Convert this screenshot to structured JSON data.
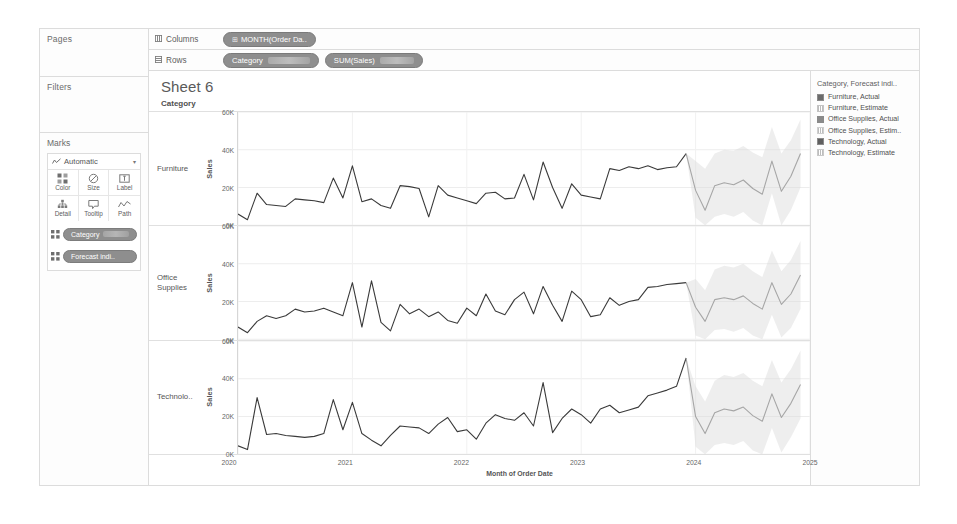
{
  "worksheet": {
    "title": "Sheet 6"
  },
  "shelves": {
    "pages_label": "Pages",
    "filters_label": "Filters",
    "marks_label": "Marks",
    "columns_label": "Columns",
    "rows_label": "Rows",
    "columns_pills": [
      {
        "name": "columns-pill-month-order-date",
        "label": "MONTH(Order Da..",
        "glyph": "⊞"
      }
    ],
    "rows_pills": [
      {
        "name": "rows-pill-category",
        "label": "Category",
        "glyph": ""
      },
      {
        "name": "rows-pill-sum-sales",
        "label": "SUM(Sales)",
        "glyph": ""
      }
    ]
  },
  "marks": {
    "type_label": "Automatic",
    "type_icon": "line-mark-icon",
    "caret": "▾",
    "buttons": [
      {
        "name": "marks-color-button",
        "label": "Color",
        "icon": "color-icon"
      },
      {
        "name": "marks-size-button",
        "label": "Size",
        "icon": "size-icon"
      },
      {
        "name": "marks-label-button",
        "label": "Label",
        "icon": "label-icon"
      },
      {
        "name": "marks-detail-button",
        "label": "Detail",
        "icon": "detail-icon"
      },
      {
        "name": "marks-tooltip-button",
        "label": "Tooltip",
        "icon": "tooltip-icon"
      },
      {
        "name": "marks-path-button",
        "label": "Path",
        "icon": "path-icon"
      }
    ],
    "pills": [
      {
        "name": "marks-pill-category",
        "label": "Category"
      },
      {
        "name": "marks-pill-forecast-indicator",
        "label": "Forecast indi.."
      }
    ]
  },
  "legend": {
    "title": "Category, Forecast indi..",
    "items": [
      {
        "label": "Furniture, Actual",
        "style": "solid",
        "color": "#6b6b6b"
      },
      {
        "label": "Furniture, Estimate",
        "style": "hatch",
        "color": "#c4c4c4"
      },
      {
        "label": "Office Supplies, Actual",
        "style": "solid",
        "color": "#8a8a8a"
      },
      {
        "label": "Office Supplies, Estim..",
        "style": "hatch",
        "color": "#cfcfcf"
      },
      {
        "label": "Technology, Actual",
        "style": "solid",
        "color": "#5f5f5f"
      },
      {
        "label": "Technology, Estimate",
        "style": "hatch",
        "color": "#c9c9c9"
      }
    ]
  },
  "chart_data": {
    "type": "line",
    "title": "Sheet 6",
    "xlabel": "Month of Order Date",
    "ylabel": "Sales",
    "row_header": "Category",
    "grid": true,
    "legend_position": "right",
    "xlim": [
      2020.0,
      2025.0
    ],
    "xticks": [
      "2020",
      "2021",
      "2022",
      "2023",
      "2024",
      "2025"
    ],
    "xtick_values": [
      2020,
      2021,
      2022,
      2023,
      2024,
      2025
    ],
    "ylim": [
      0,
      60000
    ],
    "yticks": [
      "0K",
      "20K",
      "40K",
      "60K"
    ],
    "ytick_values": [
      0,
      20000,
      40000,
      60000
    ],
    "forecast_start": 2023.92,
    "panels": [
      {
        "category": "Furniture",
        "label": "Furniture",
        "actual": {
          "x": [
            2020.0,
            2020.083,
            2020.167,
            2020.25,
            2020.333,
            2020.417,
            2020.5,
            2020.583,
            2020.667,
            2020.75,
            2020.833,
            2020.917,
            2021.0,
            2021.083,
            2021.167,
            2021.25,
            2021.333,
            2021.417,
            2021.5,
            2021.583,
            2021.667,
            2021.75,
            2021.833,
            2021.917,
            2022.0,
            2022.083,
            2022.167,
            2022.25,
            2022.333,
            2022.417,
            2022.5,
            2022.583,
            2022.667,
            2022.75,
            2022.833,
            2022.917,
            2023.0,
            2023.083,
            2023.167,
            2023.25,
            2023.333,
            2023.417,
            2023.5,
            2023.583,
            2023.667,
            2023.75,
            2023.833,
            2023.917
          ],
          "y": [
            6000,
            3000,
            17000,
            11000,
            10500,
            10000,
            14000,
            13500,
            13000,
            12000,
            25000,
            14500,
            31500,
            12500,
            14000,
            10500,
            9000,
            21000,
            20500,
            19500,
            4500,
            21000,
            16000,
            14500,
            13000,
            11500,
            17000,
            17500,
            14000,
            14500,
            27000,
            13500,
            33500,
            20000,
            9000,
            22000,
            16000,
            15000,
            14000,
            30000,
            29000,
            31000,
            30000,
            31500,
            29500,
            30500,
            31000,
            38000
          ]
        },
        "forecast": {
          "x": [
            2023.917,
            2024.0,
            2024.083,
            2024.167,
            2024.25,
            2024.333,
            2024.417,
            2024.5,
            2024.583,
            2024.667,
            2024.75,
            2024.833,
            2024.917
          ],
          "y": [
            38000,
            18500,
            8000,
            21000,
            22500,
            21500,
            24000,
            19500,
            16500,
            34000,
            18000,
            26000,
            38000
          ],
          "ci_upper": [
            38000,
            34000,
            30000,
            38000,
            40000,
            39500,
            42000,
            38500,
            36000,
            52000,
            38000,
            45000,
            56000
          ],
          "ci_lower": [
            38000,
            4000,
            0,
            4500,
            6000,
            4500,
            7000,
            2500,
            0,
            17000,
            0,
            8000,
            20000
          ]
        }
      },
      {
        "category": "Office Supplies",
        "label": "Office Supplies",
        "actual": {
          "x": [
            2020.0,
            2020.083,
            2020.167,
            2020.25,
            2020.333,
            2020.417,
            2020.5,
            2020.583,
            2020.667,
            2020.75,
            2020.833,
            2020.917,
            2021.0,
            2021.083,
            2021.167,
            2021.25,
            2021.333,
            2021.417,
            2021.5,
            2021.583,
            2021.667,
            2021.75,
            2021.833,
            2021.917,
            2022.0,
            2022.083,
            2022.167,
            2022.25,
            2022.333,
            2022.417,
            2022.5,
            2022.583,
            2022.667,
            2022.75,
            2022.833,
            2022.917,
            2023.0,
            2023.083,
            2023.167,
            2023.25,
            2023.333,
            2023.417,
            2023.5,
            2023.583,
            2023.667,
            2023.75,
            2023.833,
            2023.917
          ],
          "y": [
            6500,
            3500,
            9500,
            12500,
            11000,
            12500,
            16000,
            14500,
            15000,
            16500,
            14500,
            12500,
            30000,
            6500,
            31000,
            9000,
            4500,
            18500,
            13500,
            16000,
            12000,
            14500,
            10000,
            8500,
            16500,
            12500,
            24000,
            15000,
            13000,
            21000,
            25000,
            13500,
            28000,
            18000,
            9500,
            25500,
            21000,
            12000,
            13000,
            22000,
            18000,
            20000,
            21000,
            27500,
            28000,
            29000,
            29500,
            30000
          ]
        },
        "forecast": {
          "x": [
            2023.917,
            2024.0,
            2024.083,
            2024.167,
            2024.25,
            2024.333,
            2024.417,
            2024.5,
            2024.583,
            2024.667,
            2024.75,
            2024.833,
            2024.917
          ],
          "y": [
            30000,
            17000,
            9500,
            21000,
            22000,
            21000,
            23000,
            19000,
            16000,
            30000,
            18500,
            24000,
            34000
          ],
          "ci_upper": [
            30000,
            32000,
            26000,
            37000,
            39000,
            38000,
            40000,
            36000,
            33000,
            47000,
            36000,
            42000,
            52000
          ],
          "ci_lower": [
            30000,
            2000,
            0,
            5000,
            5500,
            4000,
            6000,
            2000,
            0,
            13000,
            1000,
            6000,
            16000
          ]
        }
      },
      {
        "category": "Technology",
        "label": "Technolo..",
        "actual": {
          "x": [
            2020.0,
            2020.083,
            2020.167,
            2020.25,
            2020.333,
            2020.417,
            2020.5,
            2020.583,
            2020.667,
            2020.75,
            2020.833,
            2020.917,
            2021.0,
            2021.083,
            2021.167,
            2021.25,
            2021.333,
            2021.417,
            2021.5,
            2021.583,
            2021.667,
            2021.75,
            2021.833,
            2021.917,
            2022.0,
            2022.083,
            2022.167,
            2022.25,
            2022.333,
            2022.417,
            2022.5,
            2022.583,
            2022.667,
            2022.75,
            2022.833,
            2022.917,
            2023.0,
            2023.083,
            2023.167,
            2023.25,
            2023.333,
            2023.417,
            2023.5,
            2023.583,
            2023.667,
            2023.75,
            2023.833,
            2023.917
          ],
          "y": [
            4500,
            2500,
            30000,
            10500,
            11000,
            10000,
            9500,
            9000,
            9500,
            11000,
            29000,
            13000,
            27500,
            11000,
            7500,
            4500,
            10000,
            15000,
            14500,
            14000,
            11000,
            16000,
            19500,
            12000,
            13000,
            8000,
            16500,
            21000,
            19000,
            18000,
            22000,
            15000,
            38000,
            11500,
            19000,
            24000,
            21000,
            16500,
            24000,
            26000,
            22000,
            23500,
            25000,
            31000,
            32500,
            34000,
            36000,
            51000
          ]
        },
        "forecast": {
          "x": [
            2023.917,
            2024.0,
            2024.083,
            2024.167,
            2024.25,
            2024.333,
            2024.417,
            2024.5,
            2024.583,
            2024.667,
            2024.75,
            2024.833,
            2024.917
          ],
          "y": [
            51000,
            20000,
            11000,
            22000,
            24000,
            23000,
            25000,
            20500,
            17500,
            32000,
            19500,
            27000,
            37000
          ],
          "ci_upper": [
            51000,
            36000,
            28000,
            39000,
            42000,
            41000,
            43000,
            39000,
            36000,
            50000,
            38000,
            45000,
            55000
          ],
          "ci_lower": [
            51000,
            4000,
            0,
            5000,
            6000,
            5000,
            7000,
            2000,
            0,
            14000,
            1000,
            9000,
            19000
          ]
        }
      }
    ]
  }
}
